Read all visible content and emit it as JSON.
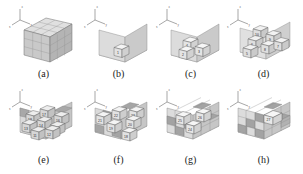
{
  "figure": {
    "background_color": "#ffffff",
    "ink_color": "#3a3a3a",
    "panel_count": 8,
    "axis_labels": {
      "x": "x",
      "y": "y",
      "z": "z"
    },
    "palette": {
      "face_top": "#e8e8e8",
      "face_left": "#cfcfcf",
      "face_right": "#bdbdbd",
      "face_dark": "#9a9a9a",
      "face_light": "#f2f2f2",
      "outline": "#555555",
      "label_text": "#1a1a1a",
      "number_text": "#2b2b2b"
    },
    "panels": [
      {
        "id": "a",
        "label": "(a)",
        "caption_text": "(a)",
        "description": "complete solid cube, no numbered blocks visible",
        "numbers": []
      },
      {
        "id": "b",
        "label": "(b)",
        "caption_text": "(b)",
        "description": "empty corner shell with first unit cube placed",
        "numbers": [
          "1"
        ]
      },
      {
        "id": "c",
        "label": "(c)",
        "caption_text": "(c)",
        "description": "three unit cubes placed in the corner",
        "numbers": [
          "2",
          "4",
          "3"
        ]
      },
      {
        "id": "d",
        "label": "(d)",
        "caption_text": "(d)",
        "description": "first layer nearly complete with stacked cubes",
        "numbers": [
          "10",
          "9",
          "6",
          "8",
          "7",
          "5"
        ]
      },
      {
        "id": "e",
        "label": "(e)",
        "caption_text": "(e)",
        "description": "second tier of cubes being added",
        "numbers": [
          "18",
          "17",
          "16",
          "14",
          "13",
          "15",
          "11",
          "12"
        ]
      },
      {
        "id": "f",
        "label": "(f)",
        "caption_text": "(f)",
        "description": "outer layer continues to close",
        "numbers": [
          "21",
          "22",
          "23",
          "19",
          "20",
          "18"
        ]
      },
      {
        "id": "g",
        "label": "(g)",
        "caption_text": "(g)",
        "description": "only a few faces remain open",
        "numbers": [
          "25",
          "26",
          "24"
        ]
      },
      {
        "id": "h",
        "label": "(h)",
        "caption_text": "(h)",
        "description": "final cube placed, assembly complete",
        "numbers": [
          "27"
        ]
      }
    ]
  }
}
